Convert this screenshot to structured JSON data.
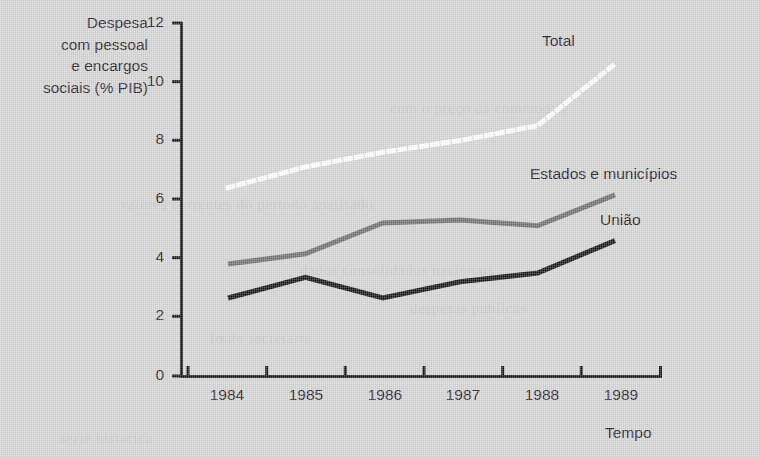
{
  "chart_data": {
    "type": "line",
    "title": "",
    "ylabel": "Despesa com pessoal e encargos sociais (% PIB)",
    "ylabel_lines": [
      "Despesa",
      "com pessoal",
      "e encargos",
      "sociais (% PIB)"
    ],
    "xlabel": "Tempo",
    "x": [
      "1984",
      "1985",
      "1986",
      "1987",
      "1988",
      "1989"
    ],
    "xtick_labels": [
      "1984",
      "1985",
      "1986",
      "1987",
      "1988",
      "1989"
    ],
    "ytick_labels": [
      "0",
      "2",
      "4",
      "6",
      "8",
      "10",
      "12"
    ],
    "ytick_values": [
      0,
      2,
      4,
      6,
      8,
      10,
      12
    ],
    "ylim": [
      0,
      12
    ],
    "grid": false,
    "legend_position": "inline-annotations",
    "series": [
      {
        "name": "Total",
        "style": "dotted",
        "color": "#ffffff",
        "values": [
          6.4,
          7.1,
          7.6,
          8.0,
          8.5,
          10.6
        ]
      },
      {
        "name": "Estados e municípios",
        "style": "solid",
        "color": "#6e6e6e",
        "values": [
          3.8,
          4.15,
          5.2,
          5.3,
          5.1,
          6.15
        ]
      },
      {
        "name": "União",
        "style": "solid",
        "color": "#111111",
        "values": [
          2.65,
          3.35,
          2.65,
          3.2,
          3.5,
          4.6
        ]
      }
    ],
    "annotations": [
      {
        "text": "Total",
        "series": "Total"
      },
      {
        "text": "Estados e municípios",
        "series": "Estados e municípios"
      },
      {
        "text": "União",
        "series": "União"
      }
    ]
  },
  "colors": {
    "background": "#d4d4d4",
    "axis": "#111111",
    "total_line": "#ffffff",
    "states_line": "#6e6e6e",
    "union_line": "#111111",
    "text": "#1c1c1c"
  }
}
